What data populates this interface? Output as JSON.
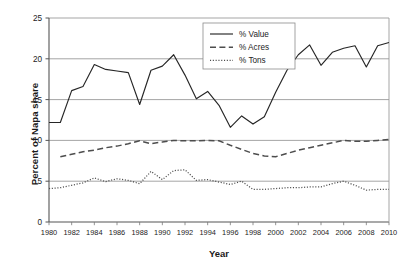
{
  "chart_data": {
    "type": "line",
    "title": "",
    "subtitle": "",
    "xlabel": "Year",
    "ylabel": "Percent of Napa share",
    "xlim": [
      1980,
      2010
    ],
    "ylim": [
      0,
      25
    ],
    "ytick_labels": [
      "0",
      "5",
      "10",
      "15",
      "20",
      "25"
    ],
    "yticks": [
      0,
      5,
      10,
      15,
      20,
      25
    ],
    "xtick_labels": [
      "1980",
      "1982",
      "1984",
      "1986",
      "1988",
      "1990",
      "1992",
      "1994",
      "1996",
      "1998",
      "2000",
      "2002",
      "2004",
      "2006",
      "2008",
      "2010"
    ],
    "xticks": [
      1980,
      1982,
      1984,
      1986,
      1988,
      1990,
      1992,
      1994,
      1996,
      1998,
      2000,
      2002,
      2004,
      2006,
      2008,
      2010
    ],
    "grid": "horizontal",
    "legend_position": "top-center",
    "x": [
      1980,
      1981,
      1982,
      1983,
      1984,
      1985,
      1986,
      1987,
      1988,
      1989,
      1990,
      1991,
      1992,
      1993,
      1994,
      1995,
      1996,
      1997,
      1998,
      1999,
      2000,
      2001,
      2002,
      2003,
      2004,
      2005,
      2006,
      2007,
      2008,
      2009,
      2010
    ],
    "series": [
      {
        "name": "% Value",
        "style": "solid",
        "color": "#262626",
        "values": [
          12.2,
          12.2,
          16.1,
          16.6,
          19.3,
          18.7,
          18.5,
          18.3,
          14.4,
          18.6,
          19.1,
          20.5,
          18.0,
          15.1,
          16.0,
          14.3,
          11.6,
          13.0,
          12.0,
          12.9,
          15.9,
          18.6,
          20.5,
          21.7,
          19.2,
          20.8,
          21.3,
          21.6,
          19.0,
          21.6,
          22.0
        ]
      },
      {
        "name": "% Acres",
        "style": "dashed",
        "color": "#4d4d4d",
        "values": [
          null,
          8.0,
          8.3,
          8.6,
          8.8,
          9.1,
          9.3,
          9.6,
          9.95,
          9.6,
          9.8,
          10.0,
          9.95,
          9.95,
          10.0,
          9.95,
          9.4,
          8.9,
          8.4,
          8.1,
          8.0,
          8.4,
          8.8,
          9.1,
          9.4,
          9.7,
          10.0,
          9.9,
          9.9,
          10.0,
          10.1
        ]
      },
      {
        "name": "% Tons",
        "style": "dotted",
        "color": "#4d4d4d",
        "values": [
          4.1,
          4.2,
          4.5,
          4.8,
          5.4,
          4.95,
          5.3,
          5.1,
          4.7,
          6.2,
          5.2,
          6.3,
          6.4,
          5.1,
          5.2,
          4.9,
          4.6,
          5.0,
          4.0,
          4.0,
          4.1,
          4.2,
          4.2,
          4.3,
          4.3,
          4.7,
          5.0,
          4.5,
          3.9,
          4.0,
          4.0
        ]
      }
    ]
  },
  "legend": {
    "items": [
      {
        "label": "% Value"
      },
      {
        "label": "% Acres"
      },
      {
        "label": "% Tons"
      }
    ]
  }
}
